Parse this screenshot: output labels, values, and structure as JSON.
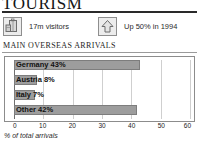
{
  "header": {
    "title": "TOURISM"
  },
  "stats": [
    {
      "icon": "luggage-icon",
      "label": "17m visitors"
    },
    {
      "icon": "up-arrow-icon",
      "label": "Up 50% in 1994"
    }
  ],
  "section": {
    "heading": "MAIN OVERSEAS ARRIVALS"
  },
  "caption": "% of total arrivals",
  "colors": {
    "bar_fill": "#9d9d9d",
    "bar_stroke": "#7d7d7d",
    "grid": "#cfcfcf",
    "frame": "#8c8c8c",
    "text": "#111111"
  },
  "chart_data": {
    "type": "bar",
    "orientation": "horizontal",
    "title": "MAIN OVERSEAS ARRIVALS",
    "xlabel": "% of total arrivals",
    "ylabel": "",
    "xlim": [
      0,
      60
    ],
    "xticks": [
      0,
      10,
      20,
      30,
      40,
      50,
      60
    ],
    "xticklabels": [
      "0",
      "10",
      "20",
      "30",
      "40",
      "50",
      "60"
    ],
    "grid": true,
    "legend": false,
    "categories": [
      "Germany",
      "Austria",
      "Italy",
      "Other"
    ],
    "values": [
      43,
      8,
      7,
      42
    ],
    "bar_labels": [
      "Germany 43%",
      "Austria 8%",
      "Italy 7%",
      "Other 42%"
    ]
  }
}
